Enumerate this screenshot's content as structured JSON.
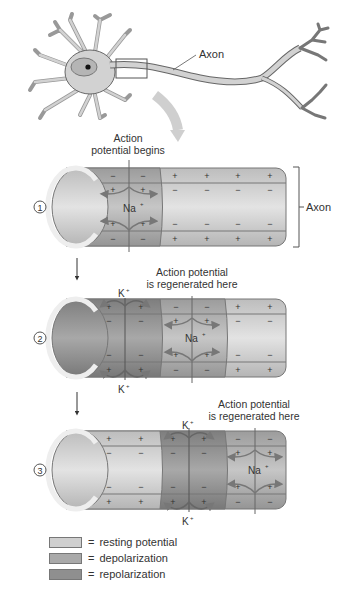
{
  "neuron": {
    "axon_label": "Axon"
  },
  "stages": [
    {
      "number": "1",
      "caption_line1": "Action",
      "caption_line2": "potential begins",
      "ion_na": "Na",
      "bracket_label": "Axon"
    },
    {
      "number": "2",
      "caption_line1": "Action potential",
      "caption_line2": "is regenerated here",
      "ion_na": "Na",
      "ion_k_top": "K",
      "ion_k_bottom": "K"
    },
    {
      "number": "3",
      "caption_line1": "Action potential",
      "caption_line2": "is regenerated here",
      "ion_na": "Na",
      "ion_k_top": "K",
      "ion_k_bottom": "K"
    }
  ],
  "signs": {
    "plus": "+",
    "minus": "−",
    "superscript": "+"
  },
  "legend": [
    {
      "label": "resting potential",
      "color": "#c9c9c9"
    },
    {
      "label": "depolarization",
      "color": "#a9a9a9"
    },
    {
      "label": "repolarization",
      "color": "#8f8f8f"
    }
  ],
  "legend_eq": "="
}
